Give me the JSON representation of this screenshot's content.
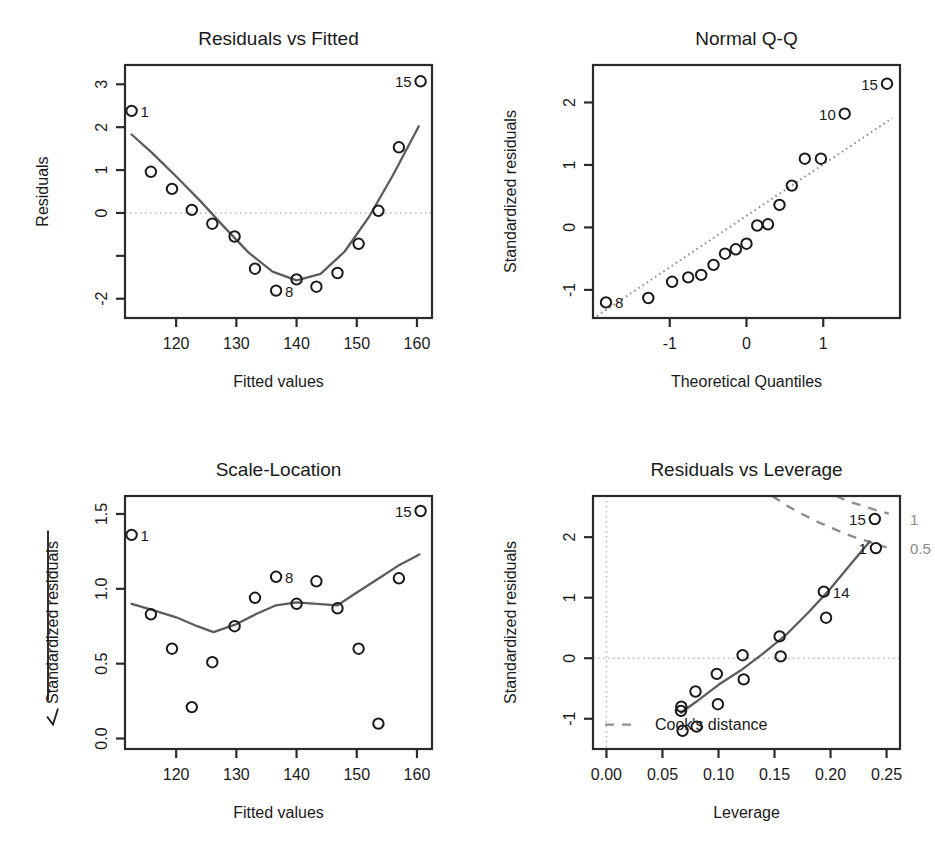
{
  "figure": {
    "kind": "regression-diagnostic-plots",
    "panel_count": 4
  },
  "chart_data": [
    {
      "id": "residuals-vs-fitted",
      "type": "scatter",
      "title": "Residuals vs Fitted",
      "xlabel": "Fitted values",
      "ylabel": "Residuals",
      "xlim": [
        111.5,
        162.5
      ],
      "ylim": [
        -2.45,
        3.45
      ],
      "xticks": [
        120,
        130,
        140,
        150,
        160
      ],
      "xticklabels": [
        "120",
        "130",
        "140",
        "150",
        "160"
      ],
      "yticks": [
        -2,
        -1,
        0,
        1,
        2,
        3
      ],
      "yticklabels": [
        "-2",
        "",
        "0",
        "1",
        "2",
        "3"
      ],
      "grid": false,
      "hline": 0,
      "x": [
        112.6,
        115.8,
        119.3,
        122.6,
        126.0,
        129.7,
        133.1,
        136.6,
        140.0,
        143.3,
        146.8,
        150.3,
        153.6,
        157.0,
        160.6
      ],
      "y": [
        2.38,
        0.96,
        0.56,
        0.07,
        -0.25,
        -0.55,
        -1.3,
        -1.81,
        -1.55,
        -1.72,
        -1.4,
        -0.72,
        0.05,
        1.53,
        3.07
      ],
      "smooth": {
        "x": [
          112.6,
          116.0,
          120.0,
          124.0,
          128.0,
          132.0,
          136.0,
          140.0,
          144.0,
          148.0,
          152.0,
          156.0,
          160.3
        ],
        "y": [
          1.83,
          1.4,
          0.85,
          0.28,
          -0.33,
          -0.92,
          -1.37,
          -1.57,
          -1.42,
          -0.9,
          -0.1,
          0.88,
          2.02
        ]
      },
      "point_labels": [
        {
          "label": "1",
          "x": 112.6,
          "y": 2.38,
          "side": "right"
        },
        {
          "label": "8",
          "x": 136.6,
          "y": -1.81,
          "side": "right"
        },
        {
          "label": "15",
          "x": 160.6,
          "y": 3.07,
          "side": "left"
        }
      ]
    },
    {
      "id": "normal-qq",
      "type": "scatter",
      "title": "Normal Q-Q",
      "xlabel": "Theoretical Quantiles",
      "ylabel": "Standardized residuals",
      "xlim": [
        -2.0,
        2.0
      ],
      "ylim": [
        -1.45,
        2.6
      ],
      "xticks": [
        -1,
        0,
        1
      ],
      "xticklabels": [
        "-1",
        "0",
        "1"
      ],
      "yticks": [
        -1,
        0,
        1,
        2
      ],
      "yticklabels": [
        "-1",
        "0",
        "1",
        "2"
      ],
      "grid": false,
      "x": [
        -1.83,
        -1.28,
        -0.97,
        -0.76,
        -0.59,
        -0.43,
        -0.28,
        -0.14,
        0.0,
        0.14,
        0.28,
        0.43,
        0.59,
        0.76,
        0.97,
        1.28,
        1.83
      ],
      "y": [
        -1.2,
        -1.13,
        -0.87,
        -0.8,
        -0.76,
        -0.6,
        -0.42,
        -0.35,
        -0.26,
        0.03,
        0.05,
        0.36,
        0.67,
        1.1,
        1.1,
        1.82,
        2.3
      ],
      "qqline": {
        "x": [
          -1.95,
          1.9
        ],
        "y": [
          -1.42,
          1.75
        ]
      },
      "point_labels": [
        {
          "label": "8",
          "x": -1.83,
          "y": -1.2,
          "side": "right"
        },
        {
          "label": "10",
          "x": 1.28,
          "y": 1.82,
          "side": "left"
        },
        {
          "label": "15",
          "x": 1.83,
          "y": 2.3,
          "side": "left"
        }
      ]
    },
    {
      "id": "scale-location",
      "type": "scatter",
      "title": "Scale-Location",
      "xlabel": "Fitted values",
      "ylabel": "Standardized residuals",
      "ylabel_prefix": "sqrt",
      "xlim": [
        111.5,
        162.5
      ],
      "ylim": [
        -0.07,
        1.62
      ],
      "xticks": [
        120,
        130,
        140,
        150,
        160
      ],
      "xticklabels": [
        "120",
        "130",
        "140",
        "150",
        "160"
      ],
      "yticks": [
        0.0,
        0.5,
        1.0,
        1.5
      ],
      "yticklabels": [
        "0.0",
        "0.5",
        "1.0",
        "1.5"
      ],
      "grid": false,
      "x": [
        112.6,
        115.8,
        119.3,
        122.6,
        126.0,
        129.7,
        133.1,
        136.6,
        140.0,
        143.3,
        146.8,
        150.3,
        153.6,
        157.0,
        160.6
      ],
      "y": [
        1.36,
        0.83,
        0.6,
        0.21,
        0.51,
        0.75,
        0.94,
        1.08,
        0.9,
        1.05,
        0.87,
        0.6,
        0.1,
        1.07,
        1.52
      ],
      "smooth": {
        "x": [
          112.6,
          116.0,
          120.0,
          123.5,
          126.2,
          129.8,
          133.2,
          136.6,
          140.0,
          143.4,
          146.8,
          150.2,
          153.7,
          157.1,
          160.4
        ],
        "y": [
          0.9,
          0.86,
          0.81,
          0.75,
          0.71,
          0.76,
          0.83,
          0.89,
          0.91,
          0.9,
          0.89,
          0.98,
          1.07,
          1.16,
          1.23
        ]
      },
      "point_labels": [
        {
          "label": "1",
          "x": 112.6,
          "y": 1.36,
          "side": "right"
        },
        {
          "label": "8",
          "x": 136.6,
          "y": 1.08,
          "side": "right"
        },
        {
          "label": "15",
          "x": 160.6,
          "y": 1.52,
          "side": "left"
        }
      ]
    },
    {
      "id": "residuals-vs-leverage",
      "type": "scatter",
      "title": "Residuals vs Leverage",
      "xlabel": "Leverage",
      "ylabel": "Standardized residuals",
      "xlim": [
        -0.012,
        0.262
      ],
      "ylim": [
        -1.5,
        2.68
      ],
      "xticks": [
        0.0,
        0.05,
        0.1,
        0.15,
        0.2,
        0.25
      ],
      "xticklabels": [
        "0.00",
        "0.05",
        "0.10",
        "0.15",
        "0.20",
        "0.25"
      ],
      "yticks": [
        -1,
        0,
        1,
        2
      ],
      "yticklabels": [
        "-1",
        "0",
        "1",
        "2"
      ],
      "grid": false,
      "hline": 0,
      "vline": 0,
      "legend": "Cook's distance",
      "legend_position": "bottom-left-inside",
      "cook_labels": [
        "1",
        "0.5"
      ],
      "x": [
        0.0665,
        0.0668,
        0.068,
        0.0795,
        0.0805,
        0.0985,
        0.0995,
        0.1215,
        0.1225,
        0.1545,
        0.1555,
        0.194,
        0.196,
        0.2395,
        0.2405
      ],
      "y": [
        -0.87,
        -0.8,
        -1.2,
        -0.55,
        -1.13,
        -0.26,
        -0.76,
        0.05,
        -0.35,
        0.36,
        0.03,
        1.1,
        0.67,
        2.3,
        1.82
      ],
      "smooth": {
        "x": [
          0.0665,
          0.08,
          0.1,
          0.12,
          0.14,
          0.16,
          0.18,
          0.2,
          0.22,
          0.235
        ],
        "y": [
          -0.9,
          -0.72,
          -0.44,
          -0.2,
          0.08,
          0.38,
          0.75,
          1.15,
          1.6,
          1.93
        ]
      },
      "cook_contours": [
        {
          "level": "0.5",
          "points": [
            [
              0.148,
              2.68
            ],
            [
              0.16,
              2.53
            ],
            [
              0.175,
              2.38
            ],
            [
              0.19,
              2.24
            ],
            [
              0.205,
              2.12
            ],
            [
              0.22,
              2.01
            ],
            [
              0.235,
              1.92
            ],
            [
              0.25,
              1.83
            ]
          ]
        },
        {
          "level": "1",
          "points": [
            [
              0.205,
              2.68
            ],
            [
              0.215,
              2.6
            ],
            [
              0.228,
              2.52
            ],
            [
              0.24,
              2.45
            ],
            [
              0.252,
              2.39
            ]
          ]
        }
      ],
      "point_labels": [
        {
          "label": "14",
          "x": 0.194,
          "y": 1.1,
          "side": "right"
        },
        {
          "label": "15",
          "x": 0.2395,
          "y": 2.3,
          "side": "left"
        },
        {
          "label": "1",
          "x": 0.2405,
          "y": 1.82,
          "side": "left"
        }
      ]
    }
  ]
}
